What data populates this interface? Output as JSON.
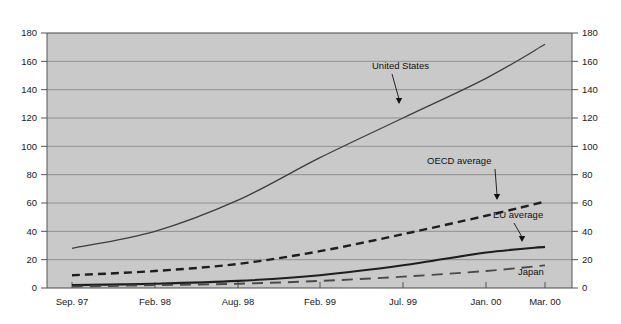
{
  "chart_data": {
    "type": "line",
    "title": "",
    "subtitle": "",
    "xlabel": "",
    "ylabel": "",
    "ylim": [
      0,
      180
    ],
    "ytick_step": 20,
    "yticks": [
      0,
      20,
      40,
      60,
      80,
      100,
      120,
      140,
      160,
      180
    ],
    "ytick_labels": [
      "0",
      "20",
      "40",
      "60",
      "80",
      "100",
      "120",
      "140",
      "160",
      "180"
    ],
    "right_axis": true,
    "right_ytick_labels": [
      "0",
      "20",
      "40",
      "60",
      "80",
      "100",
      "120",
      "140",
      "160",
      "180"
    ],
    "grid": "horizontal",
    "legend_position": "inline-annotations",
    "categories": [
      "Sep. 97",
      "Feb. 98",
      "Aug. 98",
      "Feb. 99",
      "Jul. 99",
      "Jan. 00",
      "Mar. 00"
    ],
    "x": [
      0,
      1,
      2,
      3,
      4,
      5,
      6
    ],
    "series": [
      {
        "name": "United States",
        "style": "solid-thin",
        "color": "#3c3c3c",
        "values": [
          28,
          40,
          62,
          92,
          120,
          148,
          172
        ]
      },
      {
        "name": "OECD average",
        "style": "dashed-bold",
        "color": "#1e1e1e",
        "values": [
          9,
          12,
          17,
          26,
          38,
          51,
          61
        ]
      },
      {
        "name": "EU average",
        "style": "solid-bold",
        "color": "#1e1e1e",
        "values": [
          2,
          3,
          5,
          9,
          16,
          25,
          29
        ]
      },
      {
        "name": "Japan",
        "style": "longdash",
        "color": "#4a4a4a",
        "values": [
          1,
          2,
          3,
          5,
          8,
          12,
          16
        ]
      }
    ],
    "annotations": [
      {
        "text": "United States",
        "label_x": 372,
        "label_y": 69,
        "arrow_from_x": 392,
        "arrow_from_y": 74,
        "arrow_to_x": 399,
        "arrow_to_y": 104
      },
      {
        "text": "OECD average",
        "label_x": 427,
        "label_y": 164,
        "arrow_from_x": 495,
        "arrow_from_y": 169,
        "arrow_to_x": 497,
        "arrow_to_y": 200
      },
      {
        "text": "EU average",
        "label_x": 493,
        "label_y": 218,
        "arrow_from_x": 514,
        "arrow_from_y": 223,
        "arrow_to_x": 522,
        "arrow_to_y": 242
      },
      {
        "text": "Japan",
        "label_x": 518,
        "label_y": 275,
        "arrow_from_x": null,
        "arrow_from_y": null,
        "arrow_to_x": null,
        "arrow_to_y": null
      }
    ],
    "colors": {
      "plot_background": "#c9c9c9",
      "page_background": "#ffffff",
      "gridline": "#8a8a8a",
      "axis": "#555555",
      "text": "#1a1a1a"
    }
  }
}
